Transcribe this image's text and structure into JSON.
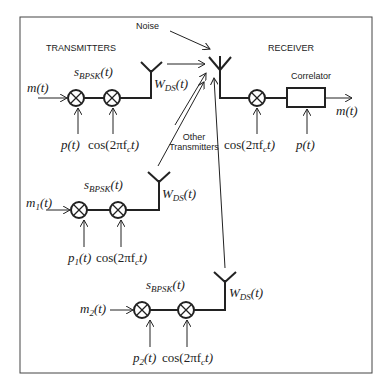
{
  "headings": {
    "transmitters": "TRANSMITTERS",
    "receiver": "RECEIVER",
    "noise": "Noise",
    "other_transmitters_line1": "Other",
    "other_transmitters_line2": "Transmitters",
    "correlator": "Correlator"
  },
  "transmitter_1": {
    "input": "m(t)",
    "signal": "s",
    "signal_sub": "BPSK",
    "signal_arg": "(t)",
    "code": "p(t)",
    "carrier": "cos(2πf",
    "carrier_sub": "c",
    "carrier_tail": "t)",
    "antenna_label": "W",
    "antenna_sub": "DS",
    "antenna_arg": "(t)"
  },
  "transmitter_2": {
    "input": "m",
    "input_sub": "1",
    "input_arg": "(t)",
    "signal": "s",
    "signal_sub": "BPSK",
    "signal_arg": "(t)",
    "code": "p",
    "code_sub": "1",
    "code_arg": "(t)",
    "carrier": "cos(2πf",
    "carrier_sub": "c",
    "carrier_tail": "t)",
    "antenna_label": "W",
    "antenna_sub": "DS",
    "antenna_arg": "(t)"
  },
  "transmitter_3": {
    "input": "m",
    "input_sub": "2",
    "input_arg": "(t)",
    "signal": "s",
    "signal_sub": "BPSK",
    "signal_arg": "(t)",
    "code": "p",
    "code_sub": "2",
    "code_arg": "(t)",
    "carrier": "cos(2πf",
    "carrier_sub": "c",
    "carrier_tail": "t)",
    "antenna_label": "W",
    "antenna_sub": "DS",
    "antenna_arg": "(t)"
  },
  "receiver": {
    "carrier": "cos(2πf",
    "carrier_sub": "c",
    "carrier_tail": "t)",
    "code": "p(t)",
    "output": "m(t)"
  }
}
